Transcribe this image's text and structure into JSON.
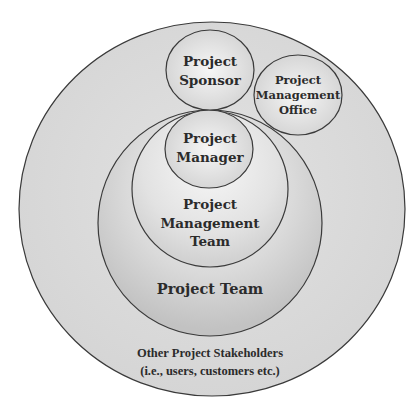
{
  "diagram": {
    "type": "nested-circles",
    "colors": {
      "background": "#ffffff",
      "outer_fill": "#d9d9d9",
      "team_fill_edge": "#c4c4c4",
      "team_fill_center": "#ececec",
      "inner_fill_center": "#f4f4f4",
      "inner_fill_edge": "#d4d4d4",
      "stroke": "#3a3a3a",
      "text": "#2b2b2b"
    },
    "nodes": [
      {
        "id": "other-stakeholders",
        "lines": [
          "Other Project Stakeholders",
          "(i.e., users, customers etc.)"
        ],
        "contains": [
          "project-team",
          "project-sponsor",
          "project-management-office"
        ]
      },
      {
        "id": "project-team",
        "lines": [
          "Project Team"
        ],
        "contains": [
          "project-management-team"
        ]
      },
      {
        "id": "project-management-team",
        "lines": [
          "Project",
          "Management",
          "Team"
        ],
        "contains": [
          "project-manager"
        ]
      },
      {
        "id": "project-manager",
        "lines": [
          "Project",
          "Manager"
        ]
      },
      {
        "id": "project-sponsor",
        "lines": [
          "Project",
          "Sponsor"
        ]
      },
      {
        "id": "project-management-office",
        "lines": [
          "Project",
          "Management",
          "Office"
        ]
      }
    ]
  }
}
